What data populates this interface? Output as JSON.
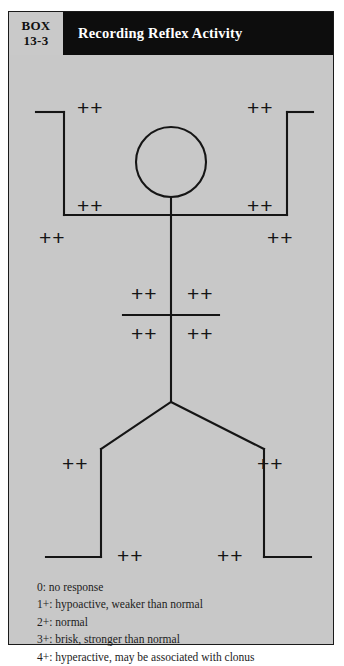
{
  "box": {
    "number_label_line1": "BOX",
    "number_label_line2": "13-3",
    "title": "Recording Reflex Activity"
  },
  "figure": {
    "marks": [
      {
        "name": "left-biceps-reflex",
        "value": "++",
        "x": 68,
        "y": 42
      },
      {
        "name": "right-biceps-reflex",
        "value": "++",
        "x": 238,
        "y": 42
      },
      {
        "name": "left-brachioradialis-reflex",
        "value": "++",
        "x": 68,
        "y": 140
      },
      {
        "name": "right-brachioradialis-reflex",
        "value": "++",
        "x": 238,
        "y": 140
      },
      {
        "name": "left-triceps-reflex",
        "value": "++",
        "x": 30,
        "y": 172
      },
      {
        "name": "right-triceps-reflex",
        "value": "++",
        "x": 258,
        "y": 172
      },
      {
        "name": "abdominal-upper-left",
        "value": "++",
        "x": 122,
        "y": 228
      },
      {
        "name": "abdominal-upper-right",
        "value": "++",
        "x": 178,
        "y": 228
      },
      {
        "name": "abdominal-lower-left",
        "value": "++",
        "x": 122,
        "y": 268
      },
      {
        "name": "abdominal-lower-right",
        "value": "++",
        "x": 178,
        "y": 268
      },
      {
        "name": "left-patellar-reflex",
        "value": "++",
        "x": 53,
        "y": 398
      },
      {
        "name": "right-patellar-reflex",
        "value": "++",
        "x": 248,
        "y": 398
      },
      {
        "name": "left-achilles-reflex",
        "value": "++",
        "x": 108,
        "y": 490
      },
      {
        "name": "right-achilles-reflex",
        "value": "++",
        "x": 208,
        "y": 490
      }
    ]
  },
  "legend": {
    "lines": [
      "0: no response",
      "1+: hypoactive, weaker than normal",
      "2+: normal",
      "3+: brisk, stronger than normal",
      "4+: hyperactive, may be associated with clonus"
    ]
  },
  "colors": {
    "panel_background": "#c8c8c8",
    "header_background": "#0d0d0d",
    "tag_background": "#c9c9c9",
    "line": "#151515",
    "title_text": "#ffffff"
  }
}
